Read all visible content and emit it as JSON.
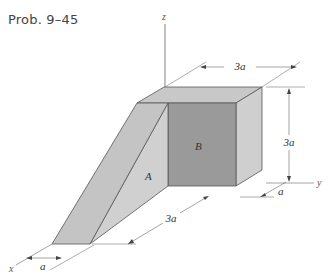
{
  "title": "Prob. 9–45",
  "diagram": {
    "axes": {
      "x": "x",
      "y": "y",
      "z": "z"
    },
    "regions": {
      "A": "A",
      "B": "B"
    },
    "dimensions": {
      "top_width": "3a",
      "height": "3a",
      "base_length": "3a",
      "right_depth": "a",
      "left_depth": "a"
    },
    "colors": {
      "top_face": "#c8c8c8",
      "front_face_B": "#9a9a9a",
      "right_face": "#cfcfcf",
      "slope_face": "#c4c4c4",
      "side_A": "#d0d0d0",
      "edge": "#555555"
    }
  }
}
